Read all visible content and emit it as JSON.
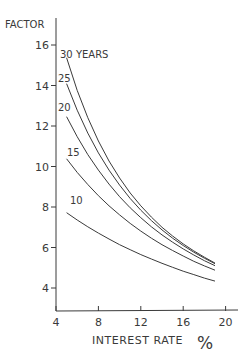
{
  "chart_data": {
    "type": "line",
    "title": "",
    "ylabel": "FACTOR",
    "xlabel": "INTEREST RATE %",
    "xlabel_text": "INTEREST RATE",
    "xlabel_unit": "%",
    "xlim": [
      4,
      21
    ],
    "ylim": [
      3,
      18
    ],
    "x_ticks": [
      4,
      8,
      12,
      16,
      20
    ],
    "y_ticks": [
      4,
      6,
      8,
      10,
      12,
      14,
      16
    ],
    "grid": false,
    "legend": "inline labels at curve starts",
    "x": [
      5,
      6,
      7,
      8,
      9,
      10,
      11,
      12,
      13,
      14,
      15,
      16,
      17,
      18,
      19
    ],
    "series": [
      {
        "name": "30 YEARS",
        "label": "30 YEARS",
        "values": [
          15.37,
          13.76,
          12.41,
          11.26,
          10.27,
          9.43,
          8.69,
          8.06,
          7.5,
          7.0,
          6.57,
          6.18,
          5.83,
          5.52,
          5.23
        ]
      },
      {
        "name": "25",
        "label": "25",
        "values": [
          14.09,
          12.78,
          11.65,
          10.67,
          9.82,
          9.08,
          8.42,
          7.84,
          7.33,
          6.87,
          6.46,
          6.1,
          5.77,
          5.47,
          5.2
        ]
      },
      {
        "name": "20",
        "label": "20",
        "values": [
          12.46,
          11.47,
          10.59,
          9.82,
          9.13,
          8.51,
          7.96,
          7.47,
          7.02,
          6.62,
          6.26,
          5.93,
          5.63,
          5.35,
          5.1
        ]
      },
      {
        "name": "15",
        "label": "15",
        "values": [
          10.38,
          9.71,
          9.11,
          8.56,
          8.06,
          7.61,
          7.19,
          6.81,
          6.46,
          6.14,
          5.85,
          5.58,
          5.32,
          5.09,
          4.88
        ]
      },
      {
        "name": "10",
        "label": "10",
        "values": [
          7.72,
          7.36,
          7.02,
          6.71,
          6.42,
          6.14,
          5.89,
          5.65,
          5.43,
          5.22,
          5.02,
          4.83,
          4.66,
          4.49,
          4.34
        ]
      }
    ]
  },
  "colors": {
    "line": "#3a3a3a",
    "background": "#ffffff"
  }
}
